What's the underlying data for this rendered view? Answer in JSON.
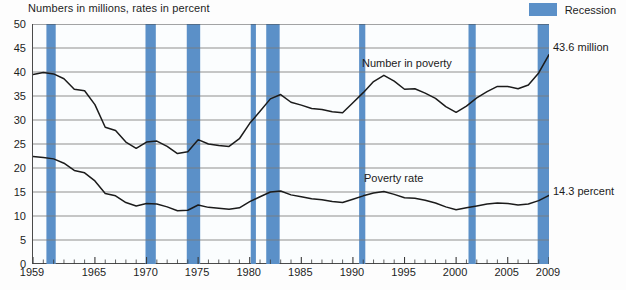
{
  "chart_title": "Numbers in millions, rates in percent",
  "legend": {
    "swatch_name": "recession-swatch",
    "label": "Recession",
    "color": "#5b90c8"
  },
  "annotations": {
    "number_in_poverty_label": "Number in poverty",
    "poverty_rate_label": "Poverty rate",
    "number_end_value": "43.6 million",
    "rate_end_value": "14.3 percent"
  },
  "chart_data": {
    "type": "line",
    "title": "Numbers in millions, rates in percent",
    "xlabel": "",
    "ylabel": "",
    "xlim": [
      1959,
      2009
    ],
    "ylim": [
      0,
      50
    ],
    "ytick_step": 5,
    "grid": true,
    "legend_position": "top-right",
    "yticks": [
      0,
      5,
      10,
      15,
      20,
      25,
      30,
      35,
      40,
      45,
      50
    ],
    "xticks_labeled": [
      1959,
      1965,
      1970,
      1975,
      1980,
      1985,
      1990,
      1995,
      2000,
      2005,
      2009
    ],
    "xticks_all_years": true,
    "line_color": "#1b1b1b",
    "x": [
      1959,
      1960,
      1961,
      1962,
      1963,
      1964,
      1965,
      1966,
      1967,
      1968,
      1969,
      1970,
      1971,
      1972,
      1973,
      1974,
      1975,
      1976,
      1977,
      1978,
      1979,
      1980,
      1981,
      1982,
      1983,
      1984,
      1985,
      1986,
      1987,
      1988,
      1989,
      1990,
      1991,
      1992,
      1993,
      1994,
      1995,
      1996,
      1997,
      1998,
      1999,
      2000,
      2001,
      2002,
      2003,
      2004,
      2005,
      2006,
      2007,
      2008,
      2009
    ],
    "series": [
      {
        "name": "Number in poverty",
        "units": "millions",
        "end_label": "43.6 million",
        "values": [
          39.5,
          39.9,
          39.6,
          38.6,
          36.4,
          36.1,
          33.2,
          28.5,
          27.8,
          25.4,
          24.1,
          25.4,
          25.6,
          24.5,
          23.0,
          23.4,
          25.9,
          25.0,
          24.7,
          24.5,
          26.1,
          29.3,
          31.8,
          34.4,
          35.3,
          33.7,
          33.1,
          32.4,
          32.2,
          31.7,
          31.5,
          33.6,
          35.7,
          38.0,
          39.3,
          38.1,
          36.4,
          36.5,
          35.6,
          34.5,
          32.8,
          31.6,
          32.9,
          34.6,
          35.9,
          37.0,
          37.0,
          36.5,
          37.3,
          39.8,
          43.6
        ]
      },
      {
        "name": "Poverty rate",
        "units": "percent",
        "end_label": "14.3 percent",
        "values": [
          22.4,
          22.2,
          21.9,
          21.0,
          19.5,
          19.0,
          17.3,
          14.7,
          14.2,
          12.8,
          12.1,
          12.6,
          12.5,
          11.9,
          11.1,
          11.2,
          12.3,
          11.8,
          11.6,
          11.4,
          11.7,
          13.0,
          14.0,
          15.0,
          15.2,
          14.4,
          14.0,
          13.6,
          13.4,
          13.0,
          12.8,
          13.5,
          14.2,
          14.8,
          15.1,
          14.5,
          13.8,
          13.7,
          13.3,
          12.7,
          11.9,
          11.3,
          11.7,
          12.1,
          12.5,
          12.7,
          12.6,
          12.3,
          12.5,
          13.2,
          14.3
        ]
      }
    ],
    "recessions": [
      {
        "start": 1960.3,
        "end": 1961.2
      },
      {
        "start": 1969.9,
        "end": 1970.9
      },
      {
        "start": 1973.9,
        "end": 1975.2
      },
      {
        "start": 1980.1,
        "end": 1980.6
      },
      {
        "start": 1981.6,
        "end": 1982.9
      },
      {
        "start": 1990.6,
        "end": 1991.2
      },
      {
        "start": 2001.2,
        "end": 2001.9
      },
      {
        "start": 2007.9,
        "end": 2009.5
      }
    ]
  }
}
